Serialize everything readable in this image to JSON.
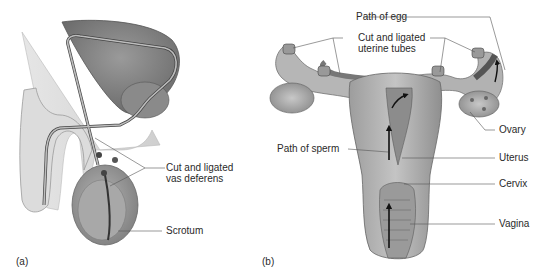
{
  "figure": {
    "panels": [
      {
        "tag": "(a)",
        "subject": "vasectomy",
        "labels": {
          "vas_deferens_line1": "Cut and ligated",
          "vas_deferens_line2": "vas deferens",
          "scrotum": "Scrotum"
        }
      },
      {
        "tag": "(b)",
        "subject": "tubal ligation",
        "labels": {
          "path_of_egg": "Path of egg",
          "uterine_tubes_line1": "Cut and ligated",
          "uterine_tubes_line2": "uterine tubes",
          "ovary": "Ovary",
          "path_of_sperm": "Path of sperm",
          "uterus": "Uterus",
          "cervix": "Cervix",
          "vagina": "Vagina"
        }
      }
    ],
    "colors": {
      "tissue_light": "#d6d6d6",
      "tissue_mid": "#a9a9a9",
      "tissue_dark": "#7d7d7d",
      "outline": "#555555",
      "leader_line": "#555555",
      "arrow": "#111111"
    }
  }
}
